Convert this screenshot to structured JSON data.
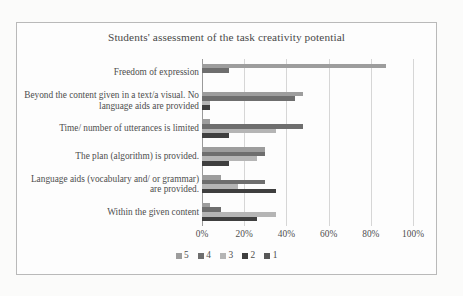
{
  "chart_data": {
    "type": "bar",
    "orientation": "horizontal",
    "title": "Students' assessment of the task creativity potential",
    "xlabel": "",
    "ylabel": "",
    "xlim": [
      0,
      100
    ],
    "xticks": [
      0,
      20,
      40,
      60,
      80,
      100
    ],
    "xtick_labels": [
      "0%",
      "20%",
      "40%",
      "60%",
      "80%",
      "100%"
    ],
    "grid": true,
    "legend_position": "bottom",
    "categories": [
      "Freedom of expression",
      "Beyond the content given in a  text/a visual. No language aids are provided",
      "Time/ number of utterances is limited",
      "The plan (algorithm) is provided.",
      "Language aids (vocabulary and/ or grammar) are provided.",
      "Within the given content"
    ],
    "series": [
      {
        "name": "5",
        "color": "#9d9d9d",
        "values": [
          87,
          48,
          4,
          30,
          9,
          4
        ]
      },
      {
        "name": "4",
        "color": "#6e6e6e",
        "values": [
          13,
          44,
          48,
          30,
          30,
          9
        ]
      },
      {
        "name": "3",
        "color": "#b5b5b5",
        "values": [
          0,
          4,
          35,
          26,
          17,
          35
        ]
      },
      {
        "name": "2",
        "color": "#3f3f3f",
        "values": [
          0,
          4,
          13,
          13,
          35,
          26
        ]
      },
      {
        "name": "1",
        "color": "#575757",
        "values": [
          0,
          0,
          0,
          0,
          0,
          0
        ]
      }
    ]
  },
  "legend": {
    "items": [
      {
        "label": "5",
        "color": "#9d9d9d"
      },
      {
        "label": "4",
        "color": "#6e6e6e"
      },
      {
        "label": "3",
        "color": "#b5b5b5"
      },
      {
        "label": "2",
        "color": "#3f3f3f"
      },
      {
        "label": "1",
        "color": "#575757"
      }
    ]
  }
}
